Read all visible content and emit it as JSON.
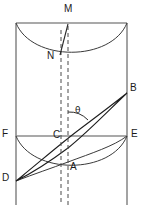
{
  "figure": {
    "canvas": {
      "width": 143,
      "height": 219
    },
    "colors": {
      "edge": "#8c8c8c",
      "curve": "#3a3a3a",
      "dashed": "#4a4a4a",
      "hatch": "#1d1d1d",
      "background": "#ffffff"
    },
    "labels": [
      {
        "id": "M",
        "text": "M",
        "x": 64,
        "y": 6,
        "anchor": "apex-top"
      },
      {
        "id": "N",
        "text": "N",
        "x": 48,
        "y": 56,
        "anchor": "upper-curve"
      },
      {
        "id": "B",
        "text": "B",
        "x": 130,
        "y": 84,
        "anchor": "right-upper"
      },
      {
        "id": "theta",
        "text": "θ",
        "x": 74,
        "y": 108,
        "anchor": "angle-vertex"
      },
      {
        "id": "F",
        "text": "F",
        "x": 2,
        "y": 130,
        "anchor": "left-mid"
      },
      {
        "id": "C",
        "text": "C",
        "x": 52,
        "y": 130,
        "anchor": "center-mid"
      },
      {
        "id": "E",
        "text": "E",
        "x": 131,
        "y": 130,
        "anchor": "right-mid"
      },
      {
        "id": "A",
        "text": "A",
        "x": 70,
        "y": 162,
        "anchor": "center-low"
      },
      {
        "id": "D",
        "text": "D",
        "x": 2,
        "y": 174,
        "anchor": "left-lower"
      }
    ],
    "geometry": {
      "left_edge_x": 16,
      "right_edge_x": 127,
      "top_y": 23,
      "bottom_y": 205,
      "mid_y": 136,
      "dashed_axis_1_x": 61,
      "dashed_axis_2_x": 68,
      "point_M": [
        68,
        23
      ],
      "point_N": [
        61,
        54
      ],
      "point_B": [
        127,
        93
      ],
      "point_C": [
        65,
        136
      ],
      "point_A": [
        68,
        162
      ],
      "point_D": [
        16,
        181
      ],
      "point_F": [
        16,
        136
      ],
      "point_E": [
        127,
        136
      ],
      "angle_label": "θ"
    },
    "elements": {
      "top_edge_name": "top-rim-line",
      "mid_edge_name": "mid-line-FE",
      "ellipse_top_name": "top-ellipse-arc",
      "ellipse_mid_name": "mid-ellipse-arc",
      "ellipse_bottom_name": "bottom-ellipse-arc",
      "hatched_region_name": "hatched-elliptical-section",
      "dashed_axis_name": "dashed-center-axis"
    }
  }
}
